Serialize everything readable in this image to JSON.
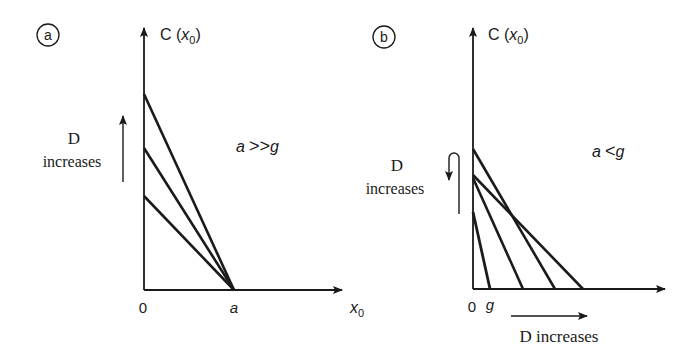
{
  "panels": [
    {
      "id": "a",
      "badge": "a",
      "y_axis_label": "C (",
      "y_axis_var": "x",
      "y_axis_sub": "0",
      "y_axis_close": ")",
      "condition_left": "a",
      "condition_op": ">>",
      "condition_right": "g",
      "arrow_label_line1": "D",
      "arrow_label_line2": "increases",
      "origin_label": "0",
      "x_tick_label": "a",
      "x_axis_var": "x",
      "x_axis_sub": "0"
    },
    {
      "id": "b",
      "badge": "b",
      "y_axis_label": "C (",
      "y_axis_var": "x",
      "y_axis_sub": "0",
      "y_axis_close": ")",
      "condition_left": "a",
      "condition_op": "<",
      "condition_right": "g",
      "arrow_label_line1": "D",
      "arrow_label_line2": "increases",
      "origin_label": "0",
      "x_tick_label": "g",
      "bottom_arrow_label": "D increases"
    }
  ],
  "colors": {
    "ink": "#1a1a1a",
    "background": "#ffffff"
  }
}
